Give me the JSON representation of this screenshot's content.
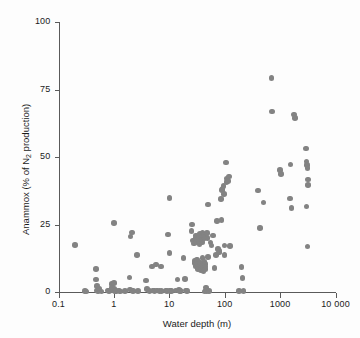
{
  "chart_data": {
    "type": "scatter",
    "title": "",
    "xlabel": "Water depth (m)",
    "ylabel": "Anammox (% of N2 production)",
    "ylabel_parts": {
      "pre": "Anammox (% of N",
      "sub": "2",
      "post": " production)"
    },
    "xscale": "log",
    "yscale": "linear",
    "xlim": [
      0.1,
      10000
    ],
    "ylim": [
      0,
      100
    ],
    "xticks": [
      0.1,
      1,
      10,
      100,
      1000,
      10000
    ],
    "xtick_labels": [
      "0.1",
      "1",
      "10",
      "100",
      "1000",
      "10 000"
    ],
    "yticks": [
      0,
      25,
      50,
      75,
      100
    ],
    "ytick_labels": [
      "0",
      "25",
      "50",
      "75",
      "100"
    ],
    "grid": false,
    "legend": "none",
    "marker_color": "#838383",
    "axis_color": "#5a5a5a",
    "marker_size_px": 5.6,
    "n_points": 152,
    "points": [
      [
        0.2,
        17.3
      ],
      [
        0.3,
        0.4
      ],
      [
        0.32,
        0.2
      ],
      [
        0.47,
        8.6
      ],
      [
        0.48,
        4.6
      ],
      [
        0.5,
        2.3
      ],
      [
        0.5,
        0.5
      ],
      [
        0.52,
        0.3
      ],
      [
        0.55,
        1.1
      ],
      [
        0.78,
        0.6
      ],
      [
        0.82,
        0.3
      ],
      [
        0.9,
        2.9
      ],
      [
        0.92,
        1.6
      ],
      [
        0.95,
        0.5
      ],
      [
        1.0,
        25.6
      ],
      [
        1.0,
        3.4
      ],
      [
        1.02,
        1.3
      ],
      [
        1.05,
        0.4
      ],
      [
        1.1,
        0.3
      ],
      [
        1.25,
        0.5
      ],
      [
        1.3,
        0.2
      ],
      [
        1.6,
        0.4
      ],
      [
        1.9,
        5.3
      ],
      [
        1.95,
        1.0
      ],
      [
        2.0,
        20.6
      ],
      [
        2.1,
        22.1
      ],
      [
        2.15,
        0.6
      ],
      [
        2.2,
        0.3
      ],
      [
        2.6,
        13.6
      ],
      [
        2.7,
        0.4
      ],
      [
        3.8,
        4.2
      ],
      [
        4.0,
        1.2
      ],
      [
        4.2,
        0.5
      ],
      [
        4.4,
        0.3
      ],
      [
        4.9,
        9.5
      ],
      [
        5.1,
        0.6
      ],
      [
        5.4,
        0.4
      ],
      [
        5.8,
        10.2
      ],
      [
        6.0,
        0.5
      ],
      [
        6.6,
        0.4
      ],
      [
        7.0,
        9.5
      ],
      [
        7.2,
        0.3
      ],
      [
        8.5,
        0.5
      ],
      [
        9.0,
        0.3
      ],
      [
        9.5,
        21.3
      ],
      [
        10.0,
        34.8
      ],
      [
        10.0,
        14.4
      ],
      [
        10.2,
        0.6
      ],
      [
        10.5,
        0.4
      ],
      [
        11.0,
        0.3
      ],
      [
        13.0,
        0.5
      ],
      [
        14.0,
        4.6
      ],
      [
        15.0,
        0.8
      ],
      [
        15.5,
        0.4
      ],
      [
        16.0,
        0.3
      ],
      [
        18.0,
        12.7
      ],
      [
        19.0,
        4.8
      ],
      [
        20.0,
        0.5
      ],
      [
        21.0,
        0.3
      ],
      [
        25.0,
        22.7
      ],
      [
        26.0,
        25.0
      ],
      [
        27.0,
        19.0
      ],
      [
        28.0,
        18.0
      ],
      [
        28.5,
        11.5
      ],
      [
        29.0,
        10.8
      ],
      [
        29.5,
        9.6
      ],
      [
        30.0,
        21.0
      ],
      [
        30.0,
        20.2
      ],
      [
        30.5,
        19.4
      ],
      [
        31.0,
        18.6
      ],
      [
        31.5,
        12.0
      ],
      [
        32.0,
        10.5
      ],
      [
        32.5,
        9.2
      ],
      [
        33.0,
        8.6
      ],
      [
        34.0,
        20.0
      ],
      [
        34.5,
        19.0
      ],
      [
        35.0,
        17.6
      ],
      [
        35.5,
        21.5
      ],
      [
        36.0,
        11.0
      ],
      [
        36.5,
        9.8
      ],
      [
        37.0,
        8.8
      ],
      [
        37.5,
        8.2
      ],
      [
        38.0,
        20.5
      ],
      [
        38.5,
        19.2
      ],
      [
        39.0,
        18.4
      ],
      [
        39.5,
        22.0
      ],
      [
        40.0,
        12.5
      ],
      [
        40.0,
        10.0
      ],
      [
        40.5,
        9.0
      ],
      [
        41.0,
        8.4
      ],
      [
        41.5,
        7.8
      ],
      [
        42.0,
        21.2
      ],
      [
        42.5,
        20.6
      ],
      [
        43.0,
        19.8
      ],
      [
        43.5,
        11.2
      ],
      [
        44.0,
        10.4
      ],
      [
        44.5,
        9.4
      ],
      [
        45.0,
        8.6
      ],
      [
        45.0,
        0.5
      ],
      [
        46.0,
        1.6
      ],
      [
        47.0,
        0.4
      ],
      [
        48.0,
        21.8
      ],
      [
        49.0,
        20.0
      ],
      [
        50.0,
        32.4
      ],
      [
        50.0,
        13.0
      ],
      [
        52.0,
        0.3
      ],
      [
        55.0,
        18.3
      ],
      [
        58.0,
        17.2
      ],
      [
        62.0,
        21.0
      ],
      [
        65.0,
        8.8
      ],
      [
        70.0,
        13.6
      ],
      [
        72.0,
        26.4
      ],
      [
        75.0,
        16.0
      ],
      [
        78.0,
        14.6
      ],
      [
        80.0,
        15.2
      ],
      [
        85.0,
        34.5
      ],
      [
        88.0,
        26.6
      ],
      [
        90.0,
        37.8
      ],
      [
        92.0,
        38.4
      ],
      [
        95.0,
        39.2
      ],
      [
        98.0,
        36.4
      ],
      [
        100.0,
        13.8
      ],
      [
        100.0,
        17.2
      ],
      [
        105.0,
        48.0
      ],
      [
        108.0,
        40.8
      ],
      [
        110.0,
        42.0
      ],
      [
        115.0,
        41.2
      ],
      [
        120.0,
        42.8
      ],
      [
        125.0,
        17.0
      ],
      [
        200.0,
        9.2
      ],
      [
        210.0,
        5.2
      ],
      [
        400.0,
        37.6
      ],
      [
        430.0,
        23.6
      ],
      [
        500.0,
        33.2
      ],
      [
        700.0,
        79.2
      ],
      [
        720.0,
        66.8
      ],
      [
        1000.0,
        45.2
      ],
      [
        1050.0,
        43.8
      ],
      [
        1500.0,
        34.6
      ],
      [
        1550.0,
        47.2
      ],
      [
        1600.0,
        31.2
      ],
      [
        1800.0,
        65.8
      ],
      [
        1850.0,
        64.4
      ],
      [
        2900.0,
        53.2
      ],
      [
        3000.0,
        48.4
      ],
      [
        3050.0,
        47.0
      ],
      [
        3100.0,
        46.0
      ],
      [
        3150.0,
        41.6
      ],
      [
        3200.0,
        39.6
      ],
      [
        3000.0,
        31.6
      ],
      [
        3100.0,
        16.8
      ],
      [
        220.0,
        0.3
      ],
      [
        180.0,
        0.4
      ],
      [
        43.0,
        0.2
      ],
      [
        0.6,
        0.2
      ]
    ]
  }
}
